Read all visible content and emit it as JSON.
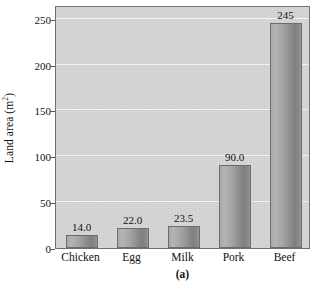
{
  "chart_data": {
    "type": "bar",
    "title": "",
    "subtitle": "",
    "caption": "(a)",
    "xlabel": "",
    "ylabel": "Land area (m",
    "ylabel_sup": "2",
    "ylabel_tail": ")",
    "ylabel_full": "Land area (m2)",
    "categories": [
      "Chicken",
      "Egg",
      "Milk",
      "Pork",
      "Beef"
    ],
    "values": [
      14.0,
      22.0,
      23.5,
      90.0,
      245
    ],
    "value_labels": [
      "14.0",
      "22.0",
      "23.5",
      "90.0",
      "245"
    ],
    "ylim": [
      0,
      265
    ],
    "yticks": [
      0,
      50,
      100,
      150,
      200,
      250
    ],
    "ytick_labels": [
      "0",
      "50",
      "100",
      "150",
      "200",
      "250"
    ],
    "grid": true,
    "grid_axis": "y",
    "legend": null,
    "series": [
      {
        "name": "Land area",
        "values": [
          14.0,
          22.0,
          23.5,
          90.0,
          245
        ]
      }
    ],
    "colors": {
      "plot_background": "#d7d7d7",
      "bar_light": "#b4b4b4",
      "bar_dark": "#7f7f7f",
      "bar_border": "#6c6c6c",
      "gridline": "#f2f2f2",
      "axis": "#6f6f6f",
      "text": "#111111",
      "page_background": "#ffffff"
    }
  }
}
